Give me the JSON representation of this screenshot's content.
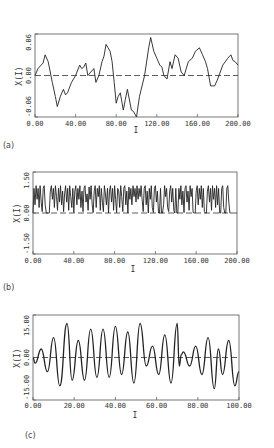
{
  "chart_data": [
    {
      "type": "line",
      "panel_label": "(a)",
      "xlabel": "I",
      "ylabel": "X(I)",
      "xlim": [
        0,
        200
      ],
      "ylim": [
        -0.06,
        0.06
      ],
      "xticks": [
        "0.00",
        "40.00",
        "80.00",
        "120.00",
        "160.00",
        "200.00"
      ],
      "yticks": [
        "-0.06",
        "0.00",
        "0.06"
      ],
      "dashed_zero_line": true,
      "series": [
        {
          "name": "X(I)",
          "x": [
            0,
            3,
            6,
            8,
            10,
            13,
            17,
            20,
            22,
            25,
            28,
            30,
            32,
            36,
            40,
            44,
            46,
            48,
            50,
            52,
            55,
            58,
            60,
            63,
            66,
            68,
            70,
            72,
            74,
            76,
            78,
            80,
            82,
            84,
            87,
            89,
            91,
            95,
            97,
            100,
            103,
            108,
            112,
            114,
            117,
            120,
            123,
            125,
            127,
            130,
            133,
            135,
            138,
            141,
            144,
            147,
            151,
            155,
            158,
            162,
            165,
            168,
            170,
            173,
            177,
            180,
            185,
            190,
            193,
            195,
            197,
            200
          ],
          "y": [
            0.0,
            0.01,
            0.015,
            0.018,
            0.03,
            0.02,
            -0.01,
            -0.03,
            -0.045,
            -0.03,
            -0.02,
            -0.028,
            -0.025,
            -0.01,
            0.0,
            0.015,
            0.01,
            0.012,
            0.018,
            0.0,
            0.005,
            0.01,
            -0.01,
            0.0,
            0.02,
            0.028,
            0.045,
            0.04,
            0.035,
            0.02,
            -0.01,
            -0.04,
            -0.03,
            -0.025,
            -0.05,
            -0.035,
            -0.02,
            -0.05,
            -0.052,
            -0.06,
            -0.03,
            0.0,
            0.04,
            0.055,
            0.035,
            0.025,
            0.015,
            0.012,
            0.0,
            -0.005,
            0.02,
            0.01,
            0.03,
            0.025,
            0.005,
            0.0,
            0.02,
            0.025,
            0.035,
            0.04,
            0.03,
            0.02,
            0.01,
            -0.015,
            -0.015,
            -0.005,
            0.015,
            0.025,
            0.03,
            0.022,
            0.02,
            0.015
          ]
        }
      ]
    },
    {
      "type": "line",
      "panel_label": "(b)",
      "xlabel": "I",
      "ylabel": "X(I)",
      "xlim": [
        0,
        200
      ],
      "ylim": [
        -1.5,
        1.5
      ],
      "xticks": [
        "0.00",
        "40.00",
        "80.00",
        "120.00",
        "160.00",
        "200.00"
      ],
      "yticks": [
        "-1.50",
        "0.00",
        "1.50"
      ],
      "dashed_zero_line": true,
      "series": [
        {
          "name": "X(I)",
          "x": [
            0,
            1,
            2,
            3,
            4,
            5,
            6,
            7,
            8,
            9,
            10,
            11,
            12,
            13,
            16,
            17,
            18,
            19,
            20,
            21,
            22,
            23,
            24,
            25,
            26,
            27,
            28,
            29,
            30,
            31,
            32,
            33,
            34,
            35,
            36,
            37,
            38,
            39,
            40,
            41,
            42,
            43,
            44,
            45,
            46,
            47,
            48,
            49,
            50,
            51,
            52,
            53,
            54,
            55,
            56,
            57,
            58,
            59,
            60,
            61,
            62,
            63,
            64,
            65,
            66,
            67,
            68,
            69,
            70,
            71,
            72,
            73,
            74,
            75,
            76,
            77,
            78,
            79,
            80,
            81,
            82,
            83,
            84,
            85,
            86,
            87,
            88,
            89,
            90,
            91,
            92,
            93,
            94,
            95,
            96,
            97,
            98,
            99,
            100,
            101,
            102,
            103,
            104,
            105,
            106,
            107,
            108,
            109,
            110,
            111,
            112,
            113,
            114,
            115,
            116,
            117,
            118,
            119,
            120,
            121,
            122,
            123,
            124,
            125,
            126,
            127,
            128,
            129,
            130,
            131,
            132,
            133,
            134,
            135,
            136,
            137,
            138,
            139,
            140,
            141,
            142,
            143,
            144,
            145,
            146,
            147,
            148,
            149,
            150,
            151,
            152,
            153,
            154,
            155,
            156,
            157,
            158,
            159,
            160,
            161,
            162,
            163,
            164,
            165,
            166,
            167,
            168,
            169,
            170,
            171,
            172,
            173,
            174,
            175,
            176,
            177,
            178,
            179,
            180,
            181,
            182,
            183,
            184,
            185,
            186,
            187,
            188,
            189,
            190,
            191,
            192,
            193,
            194,
            195,
            196,
            197,
            198,
            199,
            200
          ],
          "y": [
            0.0,
            0.9,
            0.3,
            1.0,
            0.5,
            0.9,
            0.2,
            1.0,
            0.4,
            0.05,
            0.9,
            1.0,
            0.3,
            0.0,
            0.0,
            0.8,
            1.0,
            0.5,
            0.9,
            0.2,
            1.0,
            0.6,
            0.1,
            0.9,
            0.4,
            1.0,
            0.3,
            0.8,
            0.05,
            0.7,
            1.0,
            0.4,
            0.9,
            0.1,
            1.0,
            0.6,
            0.2,
            0.9,
            0.02,
            0.8,
            1.0,
            0.3,
            0.9,
            0.5,
            1.0,
            0.2,
            0.8,
            0.05,
            0.9,
            1.0,
            0.4,
            0.7,
            0.1,
            0.95,
            0.5,
            1.0,
            0.3,
            0.02,
            0.8,
            1.0,
            0.2,
            0.9,
            0.6,
            1.0,
            0.1,
            0.9,
            0.4,
            0.05,
            1.0,
            0.7,
            0.3,
            0.9,
            0.0,
            0.8,
            1.0,
            0.4,
            0.9,
            0.1,
            1.0,
            0.5,
            0.02,
            0.9,
            0.8,
            0.2,
            1.0,
            0.6,
            0.05,
            0.9,
            1.0,
            0.3,
            0.8,
            0.0,
            0.95,
            0.5,
            0.9,
            0.3,
            1.0,
            0.6,
            0.9,
            0.4,
            1.0,
            0.5,
            0.9,
            0.6,
            1.0,
            0.5,
            0.05,
            0.9,
            1.0,
            0.3,
            0.8,
            0.0,
            0.9,
            0.5,
            1.0,
            0.2,
            0.02,
            0.9,
            1.0,
            0.4,
            0.8,
            0.0,
            0.0,
            0.9,
            0.0,
            0.0,
            0.3,
            1.0,
            0.6,
            0.9,
            0.2,
            0.05,
            0.8,
            1.0,
            0.4,
            0.9,
            0.1,
            0.0,
            0.9,
            0.0,
            0.0,
            0.9,
            0.5,
            1.0,
            0.3,
            0.8,
            0.02,
            0.9,
            1.0,
            0.4,
            0.8,
            0.1,
            1.0,
            0.6,
            0.9,
            0.02,
            0.0,
            0.0,
            0.8,
            1.0,
            0.3,
            0.9,
            0.5,
            1.0,
            0.2,
            0.9,
            0.05,
            0.0,
            0.0,
            0.8,
            1.0,
            0.4,
            0.9,
            0.1,
            1.0,
            0.5,
            0.9,
            0.2,
            1.0,
            0.3,
            0.9,
            0.0,
            0.0,
            0.9,
            1.0,
            0.2,
            0.0,
            0.0,
            0.9,
            1.0,
            0.4,
            0.0,
            0.0
          ]
        }
      ]
    },
    {
      "type": "line",
      "panel_label": "(c)",
      "xlabel": "I",
      "ylabel": "X(I)",
      "xlim": [
        0,
        100
      ],
      "ylim": [
        -15,
        15
      ],
      "xticks": [
        "0.00",
        "20.00",
        "40.00",
        "60.00",
        "80.00",
        "100.00"
      ],
      "yticks": [
        "-15.00",
        "0.00",
        "15.00"
      ],
      "dashed_zero_line": true,
      "series": [
        {
          "name": "X(I)",
          "x": [
            0,
            1,
            4,
            7,
            10,
            13,
            16.5,
            19,
            22,
            25,
            28,
            31,
            34,
            37,
            40,
            43,
            46,
            49,
            52,
            55,
            58,
            61,
            64,
            67,
            70,
            71,
            72,
            73,
            76,
            79,
            82,
            85,
            88,
            90,
            92,
            95,
            98,
            100
          ],
          "y": [
            0,
            -2,
            3,
            -5,
            7,
            -10,
            12,
            -8,
            6,
            -8,
            10,
            -7,
            10,
            -7,
            11,
            -6,
            9,
            -9,
            12,
            -3,
            4,
            -6,
            8,
            -9,
            12,
            -3,
            1,
            2,
            -3,
            4,
            -6,
            7,
            -11,
            3,
            -6,
            6,
            -10,
            -5
          ]
        }
      ]
    }
  ]
}
